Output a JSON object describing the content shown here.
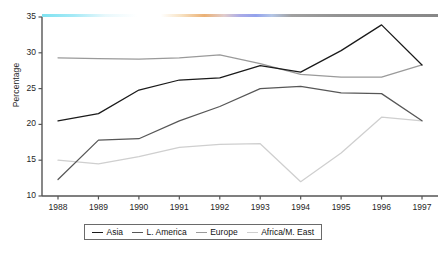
{
  "chart_data": {
    "type": "line",
    "title": "",
    "subtitle": "",
    "xlabel": "",
    "ylabel": "Percentage",
    "categories": [
      "1988",
      "1989",
      "1990",
      "1991",
      "1992",
      "1993",
      "1994",
      "1995",
      "1996",
      "1997"
    ],
    "ylim": [
      10,
      35
    ],
    "yticks": [
      10,
      15,
      20,
      25,
      30,
      35
    ],
    "ytick_labels": [
      "10",
      "15",
      "20",
      "25",
      "30",
      "35"
    ],
    "grid": false,
    "legend_position": "bottom-center",
    "series": [
      {
        "name": "Asia",
        "color": "#1a1a1a",
        "values": [
          20.5,
          21.5,
          24.8,
          26.2,
          26.5,
          28.2,
          27.3,
          30.3,
          33.9,
          28.3
        ]
      },
      {
        "name": "L. America",
        "color": "#575757",
        "values": [
          12.3,
          17.8,
          18.0,
          20.5,
          22.5,
          25.0,
          25.3,
          24.4,
          24.3,
          20.5
        ]
      },
      {
        "name": "Europe",
        "color": "#9a9a9a",
        "values": [
          29.3,
          29.2,
          29.1,
          29.3,
          29.7,
          28.5,
          27.0,
          26.6,
          26.6,
          28.3
        ]
      },
      {
        "name": "Africa/M. East",
        "color": "#cfcfcf",
        "values": [
          15.0,
          14.5,
          15.5,
          16.8,
          17.2,
          17.3,
          12.0,
          16.0,
          21.0,
          20.5
        ]
      }
    ]
  },
  "axes": {
    "y_title": "Percentage",
    "axis_color": "#555555"
  },
  "legend": {
    "items": [
      {
        "label": "Asia"
      },
      {
        "label": "L. America"
      },
      {
        "label": "Europe"
      },
      {
        "label": "Africa/M. East"
      }
    ]
  }
}
